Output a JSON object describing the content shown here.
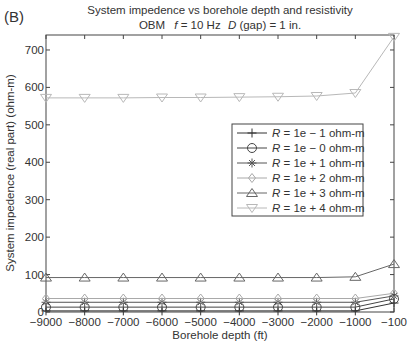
{
  "panel_label": "(B)",
  "chart_data": {
    "type": "line",
    "title": "System impedence vs borehole depth and resistivity",
    "subtitle_parts": {
      "prefix": "OBM",
      "f_symbol": "f",
      "f_text": " = 10 Hz",
      "d_symbol": "D",
      "d_text": " (gap) = 1 in."
    },
    "xlabel": "Borehole depth (ft)",
    "ylabel": "System impedence (real part) (ohm-m)",
    "categories": [
      "-9000",
      "-8000",
      "-7000",
      "-6000",
      "-5000",
      "-4000",
      "-3000",
      "-2000",
      "-1000",
      "-100"
    ],
    "x_tick_labels": [
      "−9000",
      "−8000",
      "−7000",
      "−6000",
      "−5000",
      "−4000",
      "−3000",
      "−2000",
      "−1000",
      "−100"
    ],
    "ylim": [
      0,
      740
    ],
    "y_ticks": [
      0,
      100,
      200,
      300,
      400,
      500,
      600,
      700
    ],
    "grid": false,
    "legend_position": "center-right",
    "series": [
      {
        "name": "R = 1e − 1 ohm-m",
        "r_symbol": "R",
        "r_text": " = 1e − 1 ohm-m",
        "marker": "plus",
        "color": "#333333",
        "values": [
          3,
          3,
          3,
          3,
          3,
          3,
          3,
          3,
          3,
          24
        ]
      },
      {
        "name": "R = 1e − 0 ohm-m",
        "r_symbol": "R",
        "r_text": " = 1e − 0 ohm-m",
        "marker": "circle",
        "color": "#444444",
        "values": [
          13,
          13,
          13,
          13,
          13,
          13,
          13,
          13,
          13,
          35
        ]
      },
      {
        "name": "R = 1e + 1 ohm-m",
        "r_symbol": "R",
        "r_text": " = 1e + 1 ohm-m",
        "marker": "star",
        "color": "#555555",
        "values": [
          26,
          26,
          26,
          26,
          26,
          26,
          26,
          26,
          26,
          43
        ]
      },
      {
        "name": "R = 1e + 2 ohm-m",
        "r_symbol": "R",
        "r_text": " = 1e + 2 ohm-m",
        "marker": "diamond",
        "color": "#a8a8a8",
        "values": [
          36,
          36,
          36,
          36,
          36,
          36,
          36,
          36,
          36,
          50
        ]
      },
      {
        "name": "R = 1e + 3 ohm-m",
        "r_symbol": "R",
        "r_text": " = 1e + 3 ohm-m",
        "marker": "triangle-up",
        "color": "#666666",
        "values": [
          92,
          92,
          92,
          92,
          92,
          92,
          92,
          92,
          94,
          128
        ]
      },
      {
        "name": "R = 1e + 4 ohm-m",
        "r_symbol": "R",
        "r_text": " = 1e + 4 ohm-m",
        "marker": "triangle-down",
        "color": "#b8b8b8",
        "values": [
          572,
          572,
          572,
          573,
          573,
          574,
          575,
          577,
          585,
          735
        ]
      }
    ]
  }
}
